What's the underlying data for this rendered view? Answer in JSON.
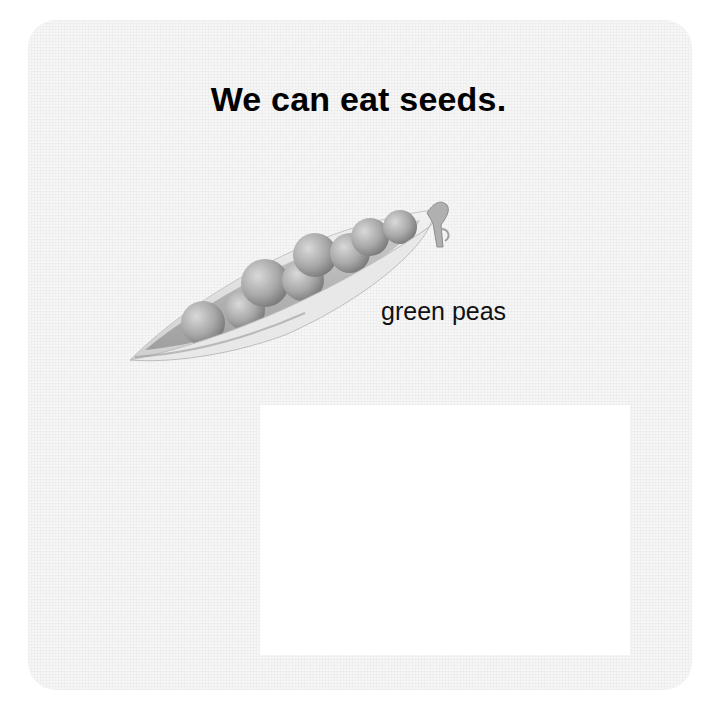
{
  "page": {
    "title": "We can eat seeds.",
    "image": {
      "subject": "pea-pod-with-peas",
      "caption": "green peas",
      "pea_count": 8
    },
    "colors": {
      "background": "#ffffff",
      "card_fill": "#f6f6f6",
      "text": "#000000"
    }
  }
}
